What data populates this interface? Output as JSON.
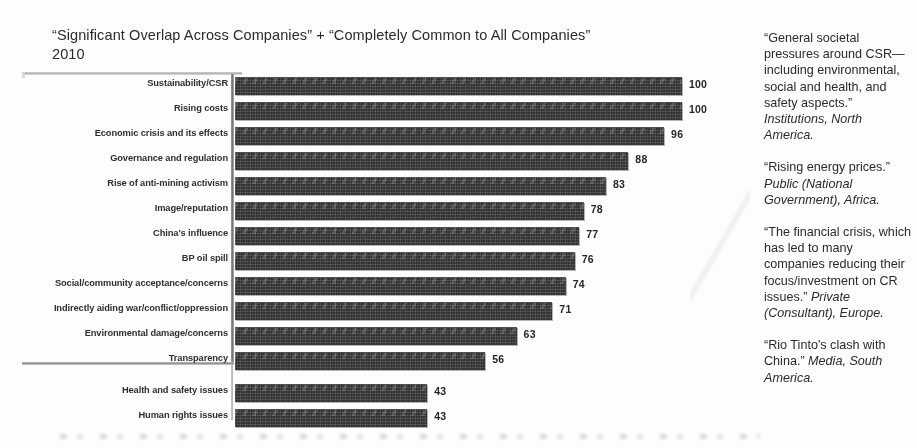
{
  "chart_data": {
    "type": "bar",
    "orientation": "horizontal",
    "title": "“Significant Overlap Across Companies” + “Completely Common to All Companies”\n2010",
    "xlabel": "",
    "ylabel": "",
    "xlim": [
      0,
      100
    ],
    "grid": false,
    "legend": null,
    "categories": [
      "Sustainability/CSR",
      "Rising costs",
      "Economic crisis and its effects",
      "Governance and regulation",
      "Rise of anti-mining activism",
      "Image/reputation",
      "China's influence",
      "BP oil spill",
      "Social/community acceptance/concerns",
      "Indirectly aiding war/conflict/oppression",
      "Environmental damage/concerns",
      "Transparency",
      "Health and safety issues",
      "Human rights issues"
    ],
    "values": [
      100,
      100,
      96,
      88,
      83,
      78,
      77,
      76,
      74,
      71,
      63,
      56,
      43,
      43
    ],
    "bar_color": "#3b3b3b",
    "divider_after_category": "Transparency"
  },
  "quotes": [
    {
      "text": "“General societal pressures around CSR—including environmental, social and health, and safety aspects.” ",
      "source": "Institutions, North America."
    },
    {
      "text": "“Rising energy prices.” ",
      "source": "Public (National Government), Africa."
    },
    {
      "text": "“The financial crisis, which has led to many companies reducing their focus/investment on CR issues.” ",
      "source": "Private (Consultant), Europe."
    },
    {
      "text": "“Rio Tinto's clash with China.” ",
      "source": "Media, South America."
    }
  ]
}
